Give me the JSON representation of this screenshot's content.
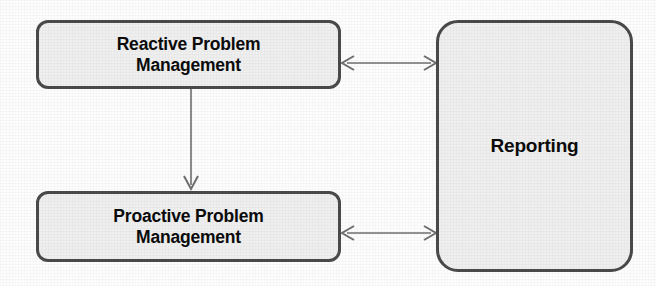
{
  "diagram": {
    "background_color": "#fdfdfd",
    "node_fill_color": "#efefef",
    "node_border_color": "#4a4a4a",
    "text_color": "#0b0b0b",
    "connector_color": "#6e6e6e",
    "nodes": [
      {
        "id": "reactive",
        "label_line1": "Reactive Problem",
        "label_line2": "Management",
        "shape": "rounded-rectangle"
      },
      {
        "id": "proactive",
        "label_line1": "Proactive Problem",
        "label_line2": "Management",
        "shape": "rounded-rectangle"
      },
      {
        "id": "reporting",
        "label_line1": "Reporting",
        "shape": "rounded-rectangle"
      }
    ],
    "connectors": [
      {
        "id": "reactive-reporting",
        "from": "reactive",
        "to": "reporting",
        "style": "double-headed-arrow",
        "orientation": "horizontal"
      },
      {
        "id": "reactive-proactive",
        "from": "reactive",
        "to": "proactive",
        "style": "single-headed-arrow",
        "orientation": "vertical-down"
      },
      {
        "id": "proactive-reporting",
        "from": "proactive",
        "to": "reporting",
        "style": "double-headed-arrow",
        "orientation": "horizontal"
      }
    ]
  }
}
